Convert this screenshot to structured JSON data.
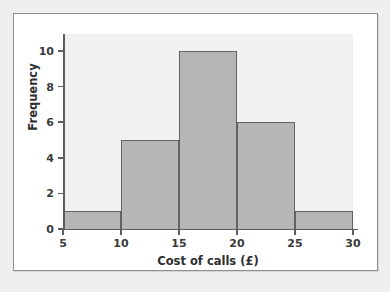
{
  "chart_data": {
    "type": "bar",
    "title": "",
    "subtitle": "",
    "xlabel": "Cost of calls (£)",
    "ylabel": "Frequency",
    "categories": [
      "5-10",
      "10-15",
      "15-20",
      "20-25",
      "25-30"
    ],
    "bin_edges": [
      5,
      10,
      15,
      20,
      25,
      30
    ],
    "values": [
      1,
      5,
      10,
      6,
      1
    ],
    "xlim": [
      5,
      30
    ],
    "ylim": [
      0,
      10
    ],
    "xticks": [
      5,
      10,
      15,
      20,
      25,
      30
    ],
    "xtick_labels": [
      "5",
      "10",
      "15",
      "20",
      "25",
      "30"
    ],
    "yticks": [
      0,
      2,
      4,
      6,
      8,
      10
    ],
    "ytick_labels": [
      "0",
      "2",
      "4",
      "6",
      "8",
      "10"
    ],
    "grid": false,
    "legend": false,
    "legend_position": "none",
    "annotations": []
  },
  "style": {
    "page_background": "#efeff0",
    "card_background": "#ffffff",
    "card_border": "#8e8e8e",
    "panel_background": "#f1f1f1",
    "bar_fill": "#b6b6b6",
    "bar_edge": "#636363",
    "axis_color": "#5d5d5d",
    "tick_label_color": "#3a3a3a",
    "axis_title_color": "#2f2f2f"
  }
}
